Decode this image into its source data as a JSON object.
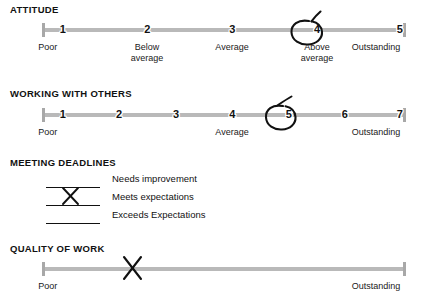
{
  "document": {
    "type": "performance-review-form",
    "ink_color": "#111111",
    "scale_color": "#b9b9b9",
    "cap_color": "#a8a8a8"
  },
  "sections": [
    {
      "id": "attitude",
      "heading": "ATTITUDE",
      "kind": "numeric-scale",
      "min": 1,
      "max": 5,
      "numbers": [
        "1",
        "2",
        "3",
        "4",
        "5"
      ],
      "labels": [
        "Poor",
        "Below\naverage",
        "Average",
        "Above\naverage",
        "Outstanding"
      ],
      "marked_value": "4",
      "mark_type": "circle"
    },
    {
      "id": "working-with-others",
      "heading": "WORKING WITH OTHERS",
      "kind": "numeric-scale",
      "min": 1,
      "max": 7,
      "numbers": [
        "1",
        "2",
        "3",
        "4",
        "5",
        "6",
        "7"
      ],
      "labels": [
        "Poor",
        "",
        "",
        "Average",
        "",
        "",
        "Outstanding"
      ],
      "marked_value": "5",
      "mark_type": "circle"
    },
    {
      "id": "meeting-deadlines",
      "heading": "MEETING DEADLINES",
      "kind": "checklist",
      "options": [
        {
          "label": "Needs improvement",
          "checked": false
        },
        {
          "label": "Meets expectations",
          "checked": true
        },
        {
          "label": "Exceeds Expectations",
          "checked": false
        }
      ]
    },
    {
      "id": "quality-of-work",
      "heading": "QUALITY OF WORK",
      "kind": "continuous-scale",
      "labels": [
        "Poor",
        "Outstanding"
      ],
      "mark_type": "x",
      "mark_position_percent": 24
    }
  ]
}
